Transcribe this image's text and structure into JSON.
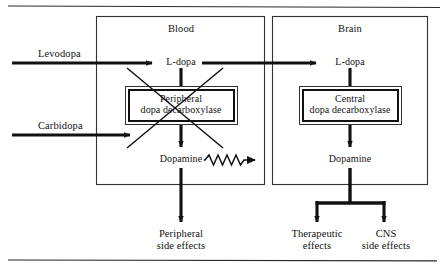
{
  "figure": {
    "ink_color": "#111111",
    "background_color": "#ffffff",
    "rule_color": "#2b2b2b"
  },
  "compartments": [
    {
      "id": "blood",
      "label": "Blood"
    },
    {
      "id": "brain",
      "label": "Brain"
    }
  ],
  "inputs": [
    {
      "id": "levodopa",
      "label": "Levodopa"
    },
    {
      "id": "carbidopa",
      "label": "Carbidopa"
    }
  ],
  "nodes": {
    "blood_ldopa": "L-dopa",
    "blood_dopamine": "Dopamine",
    "brain_ldopa": "L-dopa",
    "brain_dopamine": "Dopamine"
  },
  "enzymes": [
    {
      "id": "peripheral",
      "line1": "Peripheral",
      "line2": "dopa decarboxylase",
      "inhibited": true,
      "inhibition_marker": "x-cross"
    },
    {
      "id": "central",
      "line1": "Central",
      "line2": "dopa decarboxylase",
      "inhibited": false,
      "inhibition_marker": "none"
    }
  ],
  "outcomes": [
    {
      "id": "peripheral-side-effects",
      "line1": "Peripheral",
      "line2": "side effects"
    },
    {
      "id": "therapeutic-effects",
      "line1": "Therapeutic",
      "line2": "effects"
    },
    {
      "id": "cns-side-effects",
      "line1": "CNS",
      "line2": "side effects"
    }
  ],
  "connectors": {
    "levodopa_to_blood_ldopa": "solid-arrow",
    "carbidopa_to_peripheral_enzyme": "solid-arrow",
    "blood_ldopa_to_brain_ldopa": "solid-arrow",
    "blood_ldopa_to_peripheral_enzyme": "solid-line",
    "peripheral_enzyme_to_blood_dopamine": "solid-arrow",
    "blood_dopamine_to_brain": "wavy-arrow",
    "blood_dopamine_to_peripheral_side_effects": "solid-arrow",
    "brain_ldopa_to_central_enzyme": "solid-line",
    "central_enzyme_to_brain_dopamine": "solid-arrow",
    "brain_dopamine_fork": "split-arrow"
  }
}
